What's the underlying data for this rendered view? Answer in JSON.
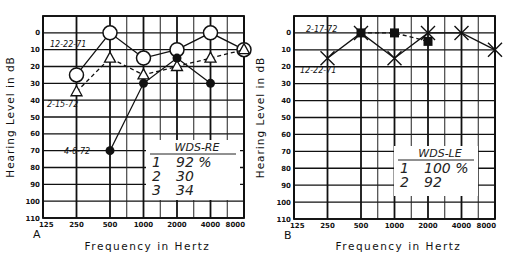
{
  "chart_data": [
    {
      "type": "line",
      "panel_label": "A",
      "title": "",
      "xlabel": "Frequency in Hertz",
      "ylabel": "Hearing Level in dB",
      "x_scale": "log2",
      "x_ticks": [
        "125",
        "250",
        "500",
        "1000",
        "2000",
        "4000",
        "8000"
      ],
      "y_ticks": [
        "0",
        "10",
        "20",
        "30",
        "40",
        "50",
        "60",
        "70",
        "80",
        "90",
        "100",
        "110"
      ],
      "ylim": [
        -10,
        110
      ],
      "y_inverted": true,
      "grid": true,
      "series": [
        {
          "name": "12-22-71",
          "marker": "open-circle",
          "line": "solid",
          "x": [
            250,
            500,
            1000,
            2000,
            4000,
            8000
          ],
          "values": [
            25,
            0,
            15,
            10,
            0,
            10
          ]
        },
        {
          "name": "2-15-72",
          "marker": "open-triangle",
          "line": "dashed",
          "x": [
            250,
            500,
            1000,
            2000,
            4000,
            8000
          ],
          "values": [
            35,
            15,
            25,
            20,
            15,
            10
          ]
        },
        {
          "name": "4-6-72",
          "marker": "filled-circle",
          "line": "solid",
          "x": [
            500,
            1000,
            2000,
            4000
          ],
          "values": [
            70,
            30,
            15,
            30
          ]
        }
      ],
      "annotation_box": {
        "title": "WDS-RE",
        "rows": [
          {
            "index": "1",
            "value": "92 %"
          },
          {
            "index": "2",
            "value": "30"
          },
          {
            "index": "3",
            "value": "34"
          }
        ]
      }
    },
    {
      "type": "line",
      "panel_label": "B",
      "title": "",
      "xlabel": "Frequency in Hertz",
      "ylabel": "Hearing Level in dB",
      "x_scale": "log2",
      "x_ticks": [
        "125",
        "250",
        "500",
        "1000",
        "2000",
        "4000",
        "8000"
      ],
      "y_ticks": [
        "0",
        "10",
        "20",
        "30",
        "40",
        "50",
        "60",
        "70",
        "80",
        "90",
        "100",
        "110"
      ],
      "ylim": [
        -10,
        110
      ],
      "y_inverted": true,
      "grid": true,
      "series": [
        {
          "name": "12-22-71",
          "marker": "x",
          "line": "solid",
          "x": [
            250,
            500,
            1000,
            2000,
            4000,
            8000
          ],
          "values": [
            15,
            0,
            15,
            0,
            0,
            10
          ]
        },
        {
          "name": "2-17-72",
          "marker": "filled-square",
          "line": "dashed",
          "x": [
            500,
            1000,
            2000
          ],
          "values": [
            0,
            0,
            5
          ]
        }
      ],
      "annotation_box": {
        "title": "WDS-LE",
        "rows": [
          {
            "index": "1",
            "value": "100 %"
          },
          {
            "index": "2",
            "value": "92"
          }
        ]
      }
    }
  ]
}
